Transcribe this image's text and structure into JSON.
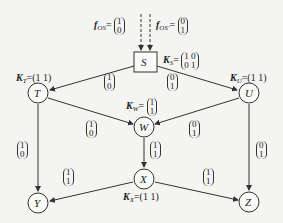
{
  "nodes": {
    "S": "S",
    "T": "T",
    "U": "U",
    "W": "W",
    "X": "X",
    "Y": "Y",
    "Z": "Z"
  },
  "sources": {
    "f1": {
      "name": "f",
      "sub": "OS",
      "vec": [
        "1",
        "0"
      ]
    },
    "f2": {
      "name": "f",
      "sub": "OS'",
      "vec": [
        "0",
        "1"
      ]
    }
  },
  "kernels": {
    "KS": {
      "name": "K",
      "sub": "S",
      "row1": "1  0",
      "row2": "0  1"
    },
    "KT": {
      "name": "K",
      "sub": "T",
      "value": "=(1  1)"
    },
    "KU": {
      "name": "K",
      "sub": "U",
      "value": "=(1  1)"
    },
    "KW": {
      "name": "K",
      "sub": "W",
      "vec": [
        "1",
        "1"
      ]
    },
    "KX": {
      "name": "K",
      "sub": "X",
      "value": "=(1  1)"
    }
  },
  "edges": {
    "ST": [
      "1",
      "0"
    ],
    "SU": [
      "0",
      "1"
    ],
    "TW": [
      "1",
      "0"
    ],
    "UW": [
      "0",
      "1"
    ],
    "TY": [
      "1",
      "0"
    ],
    "WX": [
      "1",
      "1"
    ],
    "UZ": [
      "0",
      "1"
    ],
    "XY": [
      "1",
      "1"
    ],
    "XZ": [
      "1",
      "1"
    ]
  }
}
